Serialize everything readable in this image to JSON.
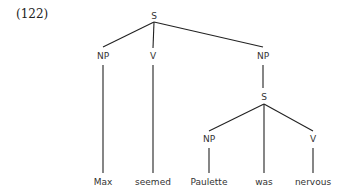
{
  "example_number": "(122)",
  "tree": {
    "nodes": [
      {
        "id": "s_root",
        "label": "S",
        "x": 154,
        "y": 18
      },
      {
        "id": "np_1",
        "label": "NP",
        "x": 103,
        "y": 58
      },
      {
        "id": "v_1",
        "label": "V",
        "x": 153,
        "y": 58
      },
      {
        "id": "np_2",
        "label": "NP",
        "x": 264,
        "y": 58
      },
      {
        "id": "s_2",
        "label": "S",
        "x": 264,
        "y": 100
      },
      {
        "id": "np_3",
        "label": "NP",
        "x": 209,
        "y": 142
      },
      {
        "id": "v_2",
        "label": "V",
        "x": 313,
        "y": 142
      }
    ],
    "leaves": [
      {
        "id": "w_max",
        "label": "Max",
        "x": 103,
        "y": 185
      },
      {
        "id": "w_seemed",
        "label": "seemed",
        "x": 153,
        "y": 185
      },
      {
        "id": "w_paulette",
        "label": "Paulette",
        "x": 209,
        "y": 185
      },
      {
        "id": "w_was",
        "label": "was",
        "x": 264,
        "y": 185
      },
      {
        "id": "w_nervous",
        "label": "nervous",
        "x": 313,
        "y": 185
      }
    ],
    "edges": [
      [
        "s_root",
        "np_1"
      ],
      [
        "s_root",
        "v_1"
      ],
      [
        "s_root",
        "np_2"
      ],
      [
        "np_1",
        "w_max"
      ],
      [
        "v_1",
        "w_seemed"
      ],
      [
        "np_2",
        "s_2"
      ],
      [
        "s_2",
        "np_3"
      ],
      [
        "s_2",
        "w_was"
      ],
      [
        "s_2",
        "v_2"
      ],
      [
        "np_3",
        "w_paulette"
      ],
      [
        "v_2",
        "w_nervous"
      ]
    ]
  }
}
